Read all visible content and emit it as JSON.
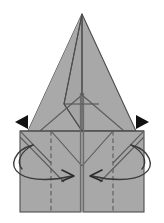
{
  "figure": {
    "type": "origami-diagram",
    "width": 164,
    "height": 223,
    "background_color": "#ffffff"
  },
  "colors": {
    "paper_fill": "#a8a8a8",
    "paper_fill_light": "#b0b0b0",
    "paper_fill_shadow": "#9c9c9c",
    "edge_stroke": "#4d4d4d",
    "crease_stroke": "#5a5a5a",
    "arrow_stroke": "#3a3a3a",
    "arrow_solid_fill": "#111111"
  },
  "shapes": {
    "upper_triangle": {
      "name": "large-point-triangle",
      "apex": [
        82,
        14
      ],
      "left_base": [
        28,
        131
      ],
      "right_base": [
        136,
        131
      ],
      "fill": "#a8a8a8"
    },
    "inner_flap": {
      "name": "inner-narrow-flap",
      "apex": [
        82,
        14
      ],
      "left": [
        63,
        103
      ],
      "bottom": [
        82,
        131
      ],
      "fill": "#a8a8a8"
    },
    "lower_rectangle": {
      "name": "base-rectangle",
      "x": 20,
      "y": 131,
      "width": 124,
      "height": 81,
      "fill": "#a8a8a8"
    }
  },
  "creases": {
    "vertical_center_seam": {
      "name": "center-seam",
      "x": 82,
      "y1": 93,
      "y2": 212,
      "style": "solid"
    },
    "valley_left": {
      "name": "valley-fold-left",
      "x": 51,
      "y1": 131,
      "y2": 212,
      "style": "dashed"
    },
    "valley_right": {
      "name": "valley-fold-right",
      "x": 113,
      "y1": 131,
      "y2": 212,
      "style": "dashed"
    },
    "diagonal_left": {
      "name": "diagonal-crease-left",
      "style": "solid"
    },
    "diagonal_right": {
      "name": "diagonal-crease-right",
      "style": "solid"
    },
    "v_crease": {
      "name": "v-crease-center",
      "style": "solid"
    }
  },
  "arrows": {
    "left_pointer": {
      "name": "solid-arrow-left",
      "direction": "left",
      "tip": [
        16,
        122
      ],
      "color": "#111111"
    },
    "right_pointer": {
      "name": "solid-arrow-right",
      "direction": "right",
      "tip": [
        148,
        122
      ],
      "color": "#111111"
    },
    "wrap_left": {
      "name": "wrap-around-arrow-left",
      "direction": "right-inward",
      "style": "curved-loop",
      "color": "#3a3a3a"
    },
    "wrap_right": {
      "name": "wrap-around-arrow-right",
      "direction": "left-inward",
      "style": "curved-loop",
      "color": "#3a3a3a"
    }
  },
  "labels": {
    "caption": ""
  }
}
